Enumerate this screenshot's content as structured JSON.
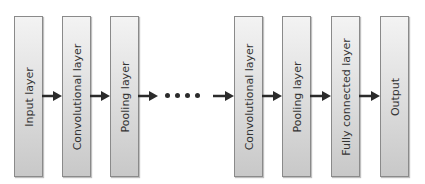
{
  "diagram": {
    "title": "",
    "layers": [
      {
        "label": "Input layer",
        "x": 14
      },
      {
        "label": "Convolutional layer",
        "x": 62
      },
      {
        "label": "Pooling layer",
        "x": 110
      },
      {
        "label": "Convolutional layer",
        "x": 234
      },
      {
        "label": "Pooling layer",
        "x": 282
      },
      {
        "label": "Fully connected layer",
        "x": 331
      },
      {
        "label": "Output",
        "x": 380
      }
    ],
    "ellipsis": "....",
    "colors": {
      "box_fill_top": "#f3f3f3",
      "box_fill_bottom": "#c8c8c8",
      "box_border": "#8a8a8a",
      "arrow": "#2b2b2b",
      "text": "#333333"
    }
  }
}
